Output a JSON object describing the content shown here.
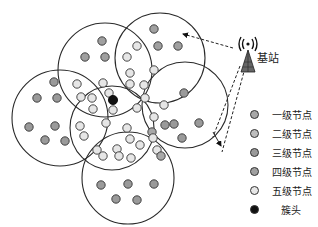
{
  "diagram": {
    "type": "wireless-sensor-network-clustering",
    "base_station": {
      "label": "基站",
      "icon": "antenna-tower-icon",
      "x": 248,
      "y": 58
    },
    "cluster_head": {
      "x": 113,
      "y": 100
    },
    "circles": [
      {
        "cx": 60,
        "cy": 118,
        "r": 48
      },
      {
        "cx": 105,
        "cy": 70,
        "r": 47
      },
      {
        "cx": 160,
        "cy": 58,
        "r": 45
      },
      {
        "cx": 112,
        "cy": 128,
        "r": 42
      },
      {
        "cx": 185,
        "cy": 105,
        "r": 43
      },
      {
        "cx": 128,
        "cy": 178,
        "r": 46
      }
    ],
    "links": [
      {
        "from": [
          233,
          48
        ],
        "to": [
          183,
          34
        ],
        "style": "dashed",
        "arrow": "end"
      },
      {
        "from": [
          240,
          66
        ],
        "to": [
          213,
          137
        ],
        "style": "dashed",
        "arrow": "none"
      },
      {
        "from": [
          245,
          68
        ],
        "to": [
          222,
          152
        ],
        "style": "dashed",
        "arrow": "none"
      },
      {
        "from": [
          213,
          132
        ],
        "to": [
          221,
          146
        ],
        "style": "arrow",
        "arrow": "end"
      }
    ],
    "nodes": [
      {
        "x": 102,
        "y": 41,
        "level": 4
      },
      {
        "x": 85,
        "y": 57,
        "level": 4
      },
      {
        "x": 105,
        "y": 57,
        "level": 4
      },
      {
        "x": 137,
        "y": 46,
        "level": 5
      },
      {
        "x": 127,
        "y": 57,
        "level": 5
      },
      {
        "x": 130,
        "y": 73,
        "level": 5
      },
      {
        "x": 154,
        "y": 29,
        "level": 4
      },
      {
        "x": 158,
        "y": 46,
        "level": 4
      },
      {
        "x": 178,
        "y": 46,
        "level": 4
      },
      {
        "x": 154,
        "y": 70,
        "level": 5
      },
      {
        "x": 144,
        "y": 85,
        "level": 5
      },
      {
        "x": 54,
        "y": 82,
        "level": 3
      },
      {
        "x": 37,
        "y": 98,
        "level": 3
      },
      {
        "x": 57,
        "y": 98,
        "level": 3
      },
      {
        "x": 77,
        "y": 84,
        "level": 5
      },
      {
        "x": 29,
        "y": 127,
        "level": 3
      },
      {
        "x": 55,
        "y": 126,
        "level": 3
      },
      {
        "x": 45,
        "y": 140,
        "level": 3
      },
      {
        "x": 65,
        "y": 141,
        "level": 3
      },
      {
        "x": 81,
        "y": 97,
        "level": 5
      },
      {
        "x": 92,
        "y": 98,
        "level": 5
      },
      {
        "x": 103,
        "y": 83,
        "level": 5
      },
      {
        "x": 109,
        "y": 93,
        "level": 5
      },
      {
        "x": 93,
        "y": 109,
        "level": 5
      },
      {
        "x": 113,
        "y": 110,
        "level": 5
      },
      {
        "x": 130,
        "y": 84,
        "level": 5
      },
      {
        "x": 145,
        "y": 98,
        "level": 5
      },
      {
        "x": 137,
        "y": 108,
        "level": 5
      },
      {
        "x": 80,
        "y": 126,
        "level": 5
      },
      {
        "x": 84,
        "y": 136,
        "level": 5
      },
      {
        "x": 106,
        "y": 123,
        "level": 5
      },
      {
        "x": 127,
        "y": 128,
        "level": 5
      },
      {
        "x": 130,
        "y": 139,
        "level": 5
      },
      {
        "x": 117,
        "y": 149,
        "level": 5
      },
      {
        "x": 97,
        "y": 150,
        "level": 5
      },
      {
        "x": 103,
        "y": 156,
        "level": 5
      },
      {
        "x": 119,
        "y": 156,
        "level": 5
      },
      {
        "x": 131,
        "y": 158,
        "level": 5
      },
      {
        "x": 140,
        "y": 145,
        "level": 5
      },
      {
        "x": 152,
        "y": 132,
        "level": 1
      },
      {
        "x": 154,
        "y": 117,
        "level": 5
      },
      {
        "x": 157,
        "y": 150,
        "level": 5
      },
      {
        "x": 164,
        "y": 105,
        "level": 5
      },
      {
        "x": 165,
        "y": 125,
        "level": 3
      },
      {
        "x": 184,
        "y": 93,
        "level": 3
      },
      {
        "x": 199,
        "y": 123,
        "level": 3
      },
      {
        "x": 174,
        "y": 124,
        "level": 3
      },
      {
        "x": 182,
        "y": 138,
        "level": 3
      },
      {
        "x": 153,
        "y": 138,
        "level": 5
      },
      {
        "x": 161,
        "y": 156,
        "level": 1
      },
      {
        "x": 101,
        "y": 185,
        "level": 3
      },
      {
        "x": 128,
        "y": 184,
        "level": 3
      },
      {
        "x": 154,
        "y": 184,
        "level": 3
      },
      {
        "x": 116,
        "y": 199,
        "level": 3
      },
      {
        "x": 137,
        "y": 200,
        "level": 3
      }
    ]
  },
  "legend": {
    "items": [
      {
        "label": "一级节点",
        "color": "#a8a8a8",
        "name": "level-1-node"
      },
      {
        "label": "二级节点",
        "color": "#bdbdbd",
        "name": "level-2-node"
      },
      {
        "label": "三级节点",
        "color": "#9a9a9a",
        "name": "level-3-node"
      },
      {
        "label": "四级节点",
        "color": "#a0a0a0",
        "name": "level-4-node"
      },
      {
        "label": "五级节点",
        "color": "#e6e6e6",
        "name": "level-5-node"
      },
      {
        "label": "簇头",
        "color": "#111111",
        "name": "cluster-head"
      }
    ]
  },
  "colors": {
    "level_1": "#a8a8a8",
    "level_2": "#bdbdbd",
    "level_3": "#9a9a9a",
    "level_4": "#a0a0a0",
    "level_5": "#e6e6e6",
    "cluster_head": "#111111",
    "stroke": "#333333"
  }
}
